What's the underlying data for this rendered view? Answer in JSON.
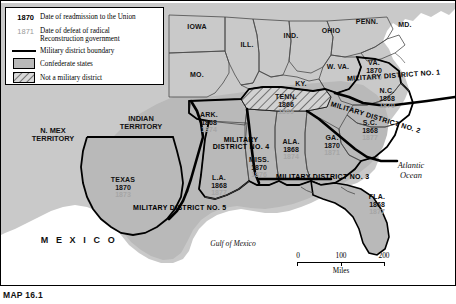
{
  "map": {
    "caption": "MAP 16.1",
    "legend": {
      "title": "",
      "items": [
        {
          "key": "1870",
          "key_style": "bold-black",
          "text": "Date of readmission to the Union"
        },
        {
          "key": "1871",
          "key_style": "gray",
          "text": "Date of defeat of radical Reconstruction government"
        },
        {
          "key": "line",
          "key_style": "swatch-line",
          "text": "Military district boundary"
        },
        {
          "key": "solid",
          "key_style": "swatch-solid",
          "text": "Confederate states"
        },
        {
          "key": "hatch",
          "key_style": "swatch-hatch",
          "text": "Not a military district"
        }
      ]
    },
    "scale": {
      "ticks": [
        "0",
        "100",
        "200"
      ],
      "unit": "Miles"
    },
    "water": {
      "atlantic": "Atlantic\nOcean",
      "atlantic_line1": "Atlantic",
      "atlantic_line2": "Ocean",
      "gulf": "Gulf of Mexico"
    },
    "mexico": "M E X I C O",
    "territories": [
      {
        "name": "N. MEX\nTERRITORY",
        "line1": "N. MEX",
        "line2": "TERRITORY"
      },
      {
        "name": "INDIAN\nTERRITORY",
        "line1": "INDIAN",
        "line2": "TERRITORY"
      }
    ],
    "union_states": [
      {
        "label": "IOWA"
      },
      {
        "label": "ILL."
      },
      {
        "label": "IND."
      },
      {
        "label": "OHIO"
      },
      {
        "label": "PENN."
      },
      {
        "label": "MD."
      },
      {
        "label": "W. VA."
      },
      {
        "label": "MO."
      },
      {
        "label": "KY."
      }
    ],
    "confederate_states": [
      {
        "abbr": "VA.",
        "readmission": "1870",
        "defeat": "1870",
        "district": "1",
        "hatched": false
      },
      {
        "abbr": "N.C.",
        "readmission": "1868",
        "defeat": "1870",
        "district": "2",
        "hatched": false
      },
      {
        "abbr": "S.C.",
        "readmission": "1868",
        "defeat": "1877",
        "district": "2",
        "hatched": false
      },
      {
        "abbr": "GA.",
        "readmission": "1870",
        "defeat": "1871",
        "district": "3",
        "hatched": false
      },
      {
        "abbr": "FLA.",
        "readmission": "1868",
        "defeat": "1877",
        "district": "3",
        "hatched": false
      },
      {
        "abbr": "ALA.",
        "readmission": "1868",
        "defeat": "1874",
        "district": "3",
        "hatched": false
      },
      {
        "abbr": "MISS.",
        "readmission": "1870",
        "defeat": "1876",
        "district": "4",
        "hatched": false
      },
      {
        "abbr": "ARK.",
        "readmission": "1868",
        "defeat": "1874",
        "district": "4",
        "hatched": false
      },
      {
        "abbr": "L.A.",
        "readmission": "1868",
        "defeat": "1877",
        "district": "5",
        "hatched": false
      },
      {
        "abbr": "TEXAS",
        "readmission": "1870",
        "defeat": "1873",
        "district": "5",
        "hatched": false
      },
      {
        "abbr": "TENN.",
        "readmission": "1866",
        "defeat": "1869",
        "district": "none",
        "hatched": true
      }
    ],
    "districts": [
      {
        "label": "MILITARY DISTRICT NO. 1"
      },
      {
        "label": "MILITARY DISTRICT NO. 2"
      },
      {
        "label": "MILITARY DISTRICT NO. 3"
      },
      {
        "label": "MILITARY",
        "label2": "DISTRICT NO. 4"
      },
      {
        "label": "MILITARY DISTRICT NO. 5"
      }
    ],
    "colors": {
      "confederate_fill": "#b9b9b9",
      "union_fill": "#c9c9c9",
      "hatch_fill": "#d2d2d2",
      "water": "#ffffff",
      "boundary": "#000000",
      "defeat_date": "#a6a6a6"
    }
  }
}
